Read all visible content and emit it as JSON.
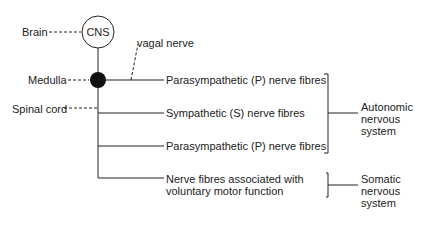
{
  "diagram": {
    "nodes": {
      "cns": "CNS",
      "brain": "Brain",
      "medulla": "Medulla",
      "spinal_cord": "Spinal cord",
      "vagal_nerve": "vagal nerve"
    },
    "branches": [
      {
        "label": "Parasympathetic (P) nerve fibres"
      },
      {
        "label": "Sympathetic (S) nerve fibres"
      },
      {
        "label": "Parasympathetic (P) nerve fibres"
      },
      {
        "label_line1": "Nerve fibres associated with",
        "label_line2": "voluntary motor function"
      }
    ],
    "groups": {
      "autonomic": {
        "line1": "Autonomic",
        "line2": "nervous",
        "line3": "system"
      },
      "somatic": {
        "line1": "Somatic",
        "line2": "nervous",
        "line3": "system"
      }
    },
    "colors": {
      "line": "#222222",
      "background": "#ffffff"
    }
  }
}
